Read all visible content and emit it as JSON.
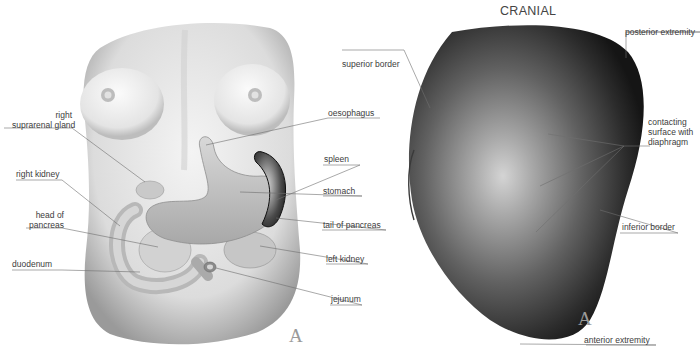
{
  "figure": {
    "left_panel": {
      "plate_letter": "A",
      "labels": {
        "right_suprarenal_gland_1": "right",
        "right_suprarenal_gland_2": "suprarenal gland",
        "right_kidney": "right kidney",
        "head_of_pancreas_1": "head of",
        "head_of_pancreas_2": "pancreas",
        "duodenum": "duodenum",
        "oesophagus": "oesophagus",
        "spleen": "spleen",
        "stomach": "stomach",
        "tail_of_pancreas": "tail of pancreas",
        "left_kidney": "left kidney",
        "jejunum": "jejunum"
      }
    },
    "right_panel": {
      "orientation": "CRANIAL",
      "plate_letter": "A",
      "labels": {
        "superior_border": "superior border",
        "posterior_extremity": "posterior extremity",
        "contacting_1": "contacting",
        "contacting_2": "surface with",
        "contacting_3": "diaphragm",
        "inferior_border": "inferior border",
        "anterior_extremity": "anterior extremity"
      }
    },
    "colors": {
      "leader_line": "#6e6e6e",
      "label_text": "#3c3c3c",
      "spleen_dark": "#1e1e1e"
    }
  }
}
